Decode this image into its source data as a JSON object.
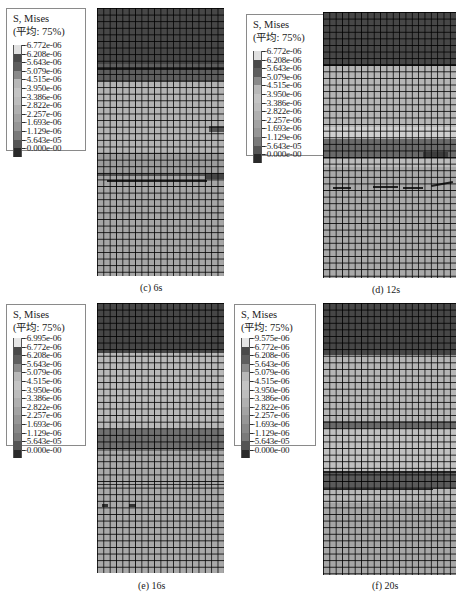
{
  "figure": {
    "legend_title": "S, Mises",
    "legend_subtitle": "(平均: 75%)",
    "colors": {
      "background": "#ffffff",
      "mesh_line": "#111111",
      "high_stress": "#3d3d3d",
      "mid_stress": "#9a9a9a",
      "low_stress": "#c4c4c4"
    },
    "panels": [
      {
        "id": "c",
        "caption": "(c)  6s",
        "legend": [
          "-6.772e-06",
          "-6.208e-06",
          "-5.643e-06",
          "-5.079e-06",
          "-4.515e-06",
          "-3.950e-06",
          "-3.386e-06",
          "-2.822e-06",
          "-2.257e-06",
          "-1.693e-06",
          "-1.129e-06",
          "-5.643e-05",
          "-0.000e-00"
        ]
      },
      {
        "id": "d",
        "caption": "(d)  12s",
        "legend": [
          "-6.772e-06",
          "-6.208e-06",
          "-5.643e-06",
          "-5.079e-06",
          "-4.515e-06",
          "-3.950e-06",
          "-3.386e-06",
          "-2.822e-06",
          "-2.257e-06",
          "-1.693e-06",
          "-1.129e-06",
          "-5.643e-05",
          "-0.000e-00"
        ]
      },
      {
        "id": "e",
        "caption": "(e)  16s",
        "legend": [
          "-6.995e-06",
          "-6.772e-06",
          "-6.208e-06",
          "-5.643e-06",
          "-5.079e-06",
          "-4.515e-06",
          "-3.950e-06",
          "-3.386e-06",
          "-2.822e-06",
          "-2.257e-06",
          "-1.693e-06",
          "-1.129e-06",
          "-5.643e-05",
          "-0.000e-00"
        ]
      },
      {
        "id": "f",
        "caption": "(f)  20s",
        "legend": [
          "-9.575e-06",
          "-6.772e-06",
          "-6.208e-06",
          "-5.643e-06",
          "-5.079e-06",
          "-4.515e-06",
          "-3.950e-06",
          "-3.386e-06",
          "-2.822e-06",
          "-2.257e-06",
          "-1.693e-06",
          "-1.129e-06",
          "-5.643e-05",
          "-0.000e-00"
        ]
      }
    ]
  }
}
